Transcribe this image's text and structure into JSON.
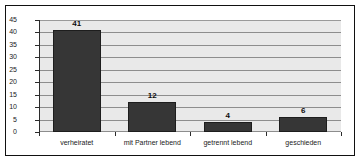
{
  "chart_data": {
    "type": "bar",
    "title": "",
    "subtitle": "",
    "xlabel": "",
    "ylabel": "",
    "categories": [
      "verheiratet",
      "mit Partner lebend",
      "getrennt lebend",
      "geschieden"
    ],
    "values": [
      41,
      12,
      4,
      6
    ],
    "data_labels": [
      "41",
      "12",
      "4",
      "6"
    ],
    "ylim": [
      0,
      45
    ],
    "ytick_step": 5,
    "yticks": [
      0,
      5,
      10,
      15,
      20,
      25,
      30,
      35,
      40,
      45
    ],
    "ytick_labels": [
      "0",
      "5",
      "10",
      "15",
      "20",
      "25",
      "30",
      "35",
      "40",
      "45"
    ],
    "grid": true,
    "grid_orientation": "horizontal",
    "legend": false,
    "legend_position": "none",
    "series": [
      {
        "name": "Familienstand",
        "values": [
          41,
          12,
          4,
          6
        ]
      }
    ],
    "colors": {
      "bar_fill": "#363636",
      "bar_edge": "#1d1d1d",
      "plot_background": "#e9e9e9",
      "gridline": "#8d8d8d",
      "axis": "#2b2b2b",
      "frame": "#111111",
      "page_background": "#ffffff",
      "text": "#1a1a1a"
    }
  }
}
